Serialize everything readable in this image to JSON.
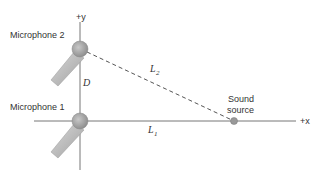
{
  "diagram": {
    "labels": {
      "y_axis": "+y",
      "x_axis": "+x",
      "mic2": "Microphone 2",
      "mic1": "Microphone 1",
      "distance_d": "D",
      "L2": "L",
      "L2_sub": "2",
      "L1": "L",
      "L1_sub": "1",
      "sound_line1": "Sound",
      "sound_line2": "source"
    },
    "colors": {
      "axis": "#666666",
      "mic_head": "#a8a8a8",
      "mic_body": "#c4c4c4",
      "dashed": "#555555",
      "source": "#999999"
    }
  }
}
